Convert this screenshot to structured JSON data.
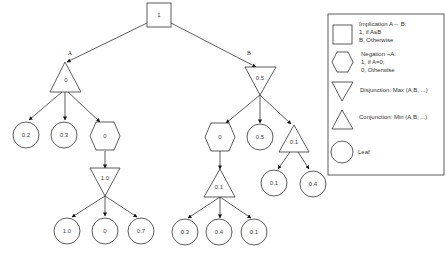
{
  "diagram": {
    "root": {
      "type": "implication",
      "value": "1"
    },
    "edge_labels": {
      "left": "A",
      "right": "B"
    },
    "nodes": {
      "a": {
        "type": "conjunction",
        "value": "0"
      },
      "a_leaf1": {
        "type": "leaf",
        "value": "0.2"
      },
      "a_leaf2": {
        "type": "leaf",
        "value": "0.3"
      },
      "a_neg": {
        "type": "negation",
        "value": "0"
      },
      "a_disj": {
        "type": "disjunction",
        "value": "1.0"
      },
      "a_leaf3": {
        "type": "leaf",
        "value": "1.0"
      },
      "a_leaf4": {
        "type": "leaf",
        "value": "0"
      },
      "a_leaf5": {
        "type": "leaf",
        "value": "0.7"
      },
      "b": {
        "type": "disjunction",
        "value": "0.5"
      },
      "b_neg": {
        "type": "negation",
        "value": "0"
      },
      "b_leaf1": {
        "type": "leaf",
        "value": "0.5"
      },
      "b_conj": {
        "type": "conjunction",
        "value": "0.1"
      },
      "b_conj2": {
        "type": "conjunction",
        "value": "0.1"
      },
      "b_leaf2": {
        "type": "leaf",
        "value": "0.3"
      },
      "b_leaf3": {
        "type": "leaf",
        "value": "0.4"
      },
      "b_leaf4": {
        "type": "leaf",
        "value": "0.1"
      },
      "b_leaf5": {
        "type": "leaf",
        "value": "0.1"
      },
      "b_leaf6": {
        "type": "leaf",
        "value": "0.4"
      }
    }
  },
  "legend": {
    "implication": {
      "line1": "Implication A→ B:",
      "line2": "1, if A≤B",
      "line3": "B, Otherwise"
    },
    "negation": {
      "line1": "Negation ¬A:",
      "line2": "1, if A=0;",
      "line3": "0, Otherwise"
    },
    "disjunction": {
      "line1": "Disjunction: Max (A,B, ...)"
    },
    "conjunction": {
      "line1": "Conjunction: Min (A,B, ...)"
    },
    "leaf": {
      "line1": "Leaf"
    }
  }
}
